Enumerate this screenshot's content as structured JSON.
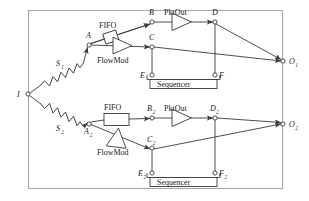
{
  "figure": {
    "kind": "block-diagram",
    "frame": {
      "stroke": "#9a9a9a",
      "fill": "#ffffff"
    },
    "line_color": "#3a3a3a"
  },
  "nodes": [
    {
      "id": "I",
      "label": "I",
      "sub": "",
      "x": 28,
      "y": 94,
      "label_side": "left"
    },
    {
      "id": "A",
      "label": "A",
      "sub": "",
      "x": 89,
      "y": 45,
      "label_side": "above"
    },
    {
      "id": "B",
      "label": "B",
      "sub": "",
      "x": 152,
      "y": 22,
      "label_side": "above"
    },
    {
      "id": "C",
      "label": "C",
      "sub": "",
      "x": 152,
      "y": 47,
      "label_side": "above"
    },
    {
      "id": "D",
      "label": "D",
      "sub": "",
      "x": 215,
      "y": 22,
      "label_side": "above"
    },
    {
      "id": "E",
      "label": "E",
      "sub": "",
      "x": 152,
      "y": 75,
      "label_side": "left"
    },
    {
      "id": "F",
      "label": "F",
      "sub": "",
      "x": 215,
      "y": 75,
      "label_side": "right"
    },
    {
      "id": "O1",
      "label": "O",
      "sub": "1",
      "x": 283,
      "y": 61,
      "label_side": "right"
    },
    {
      "id": "A2",
      "label": "A",
      "sub": "2",
      "x": 89,
      "y": 124,
      "label_side": "below"
    },
    {
      "id": "B2",
      "label": "B",
      "sub": "2",
      "x": 152,
      "y": 118,
      "label_side": "above"
    },
    {
      "id": "C2",
      "label": "C",
      "sub": "2",
      "x": 152,
      "y": 148,
      "label_side": "above"
    },
    {
      "id": "D2",
      "label": "D",
      "sub": "2",
      "x": 215,
      "y": 118,
      "label_side": "above"
    },
    {
      "id": "E2",
      "label": "E",
      "sub": "2",
      "x": 152,
      "y": 173,
      "label_side": "left"
    },
    {
      "id": "F2",
      "label": "F",
      "sub": "2",
      "x": 215,
      "y": 173,
      "label_side": "right"
    },
    {
      "id": "O2",
      "label": "O",
      "sub": "2",
      "x": 283,
      "y": 124,
      "label_side": "right"
    }
  ],
  "components": [
    {
      "id": "S1",
      "type": "spring",
      "label": "S",
      "sub": "1",
      "label_pos": "above"
    },
    {
      "id": "S2",
      "type": "spring",
      "label": "S",
      "sub": "2",
      "label_pos": "below"
    },
    {
      "id": "FIFO1",
      "type": "box",
      "label": "FIFO",
      "orientation": "slanted"
    },
    {
      "id": "FIFO2",
      "type": "box",
      "label": "FIFO",
      "orientation": "horizontal"
    },
    {
      "id": "FlowMod1",
      "type": "triangle",
      "label": "FlowMod",
      "orientation": "right"
    },
    {
      "id": "FlowMod2",
      "type": "triangle",
      "label": "FlowMod",
      "orientation": "down-right"
    },
    {
      "id": "PktOut1",
      "type": "triangle",
      "label": "PktOut",
      "orientation": "right"
    },
    {
      "id": "PktOut2",
      "type": "triangle",
      "label": "PktOut",
      "orientation": "right"
    },
    {
      "id": "Seq1",
      "type": "bracket-box",
      "label": "Sequencer"
    },
    {
      "id": "Seq2",
      "type": "bracket-box",
      "label": "Sequencer"
    }
  ],
  "edges": [
    {
      "from": "I",
      "to": "A",
      "via": "S1"
    },
    {
      "from": "I",
      "to": "A2",
      "via": "S2"
    },
    {
      "from": "A",
      "to": "B",
      "via": "FIFO1"
    },
    {
      "from": "A",
      "to": "C",
      "via": "FlowMod1"
    },
    {
      "from": "B",
      "to": "D",
      "via": "PktOut1"
    },
    {
      "from": "C",
      "to": "O1",
      "via": ""
    },
    {
      "from": "D",
      "to": "O1",
      "via": ""
    },
    {
      "from": "C",
      "to": "E",
      "via": ""
    },
    {
      "from": "D",
      "to": "F",
      "via": ""
    },
    {
      "from": "E",
      "to": "F",
      "via": "Seq1"
    },
    {
      "from": "A2",
      "to": "B2",
      "via": "FIFO2"
    },
    {
      "from": "A2",
      "to": "C2",
      "via": "FlowMod2"
    },
    {
      "from": "B2",
      "to": "D2",
      "via": "PktOut2"
    },
    {
      "from": "C2",
      "to": "O2",
      "via": ""
    },
    {
      "from": "D2",
      "to": "O2",
      "via": ""
    },
    {
      "from": "C2",
      "to": "E2",
      "via": ""
    },
    {
      "from": "D2",
      "to": "F2",
      "via": ""
    },
    {
      "from": "E2",
      "to": "F2",
      "via": "Seq2"
    }
  ],
  "labels": {
    "fifo_top": "FIFO",
    "fifo_bottom": "FIFO",
    "flowmod_top": "FlowMod",
    "flowmod_bottom": "FlowMod",
    "pktout_top": "PktOut",
    "pktout_bottom": "PktOut",
    "sequencer_top": "Sequencer",
    "sequencer_bottom": "Sequencer",
    "I": "I",
    "A": "A",
    "B": "B",
    "C": "C",
    "D": "D",
    "E": "E",
    "F": "F",
    "S": "S",
    "O": "O",
    "s1": "1",
    "s2": "2",
    "A2_base": "A",
    "B2_base": "B",
    "C2_base": "C",
    "D2_base": "D",
    "E2_base": "E",
    "F2_base": "F",
    "O1_base": "O",
    "O2_base": "O"
  }
}
